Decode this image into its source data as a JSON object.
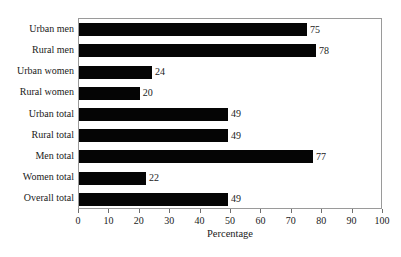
{
  "chart_data": {
    "type": "bar",
    "orientation": "horizontal",
    "title": "",
    "xlabel": "Percentage",
    "ylabel": "",
    "xlim": [
      0,
      100
    ],
    "xticks": [
      "0",
      "10",
      "20",
      "30",
      "40",
      "50",
      "60",
      "70",
      "80",
      "90",
      "100"
    ],
    "grid": false,
    "legend": false,
    "bar_color": "#050505",
    "categories": [
      "Urban men",
      "Rural men",
      "Urban women",
      "Rural women",
      "Urban total",
      "Rural total",
      "Men total",
      "Women total",
      "Overall total"
    ],
    "values": [
      75,
      78,
      24,
      20,
      49,
      49,
      77,
      22,
      49
    ],
    "value_labels": [
      "75",
      "78",
      "24",
      "20",
      "49",
      "49",
      "77",
      "22",
      "49"
    ]
  }
}
